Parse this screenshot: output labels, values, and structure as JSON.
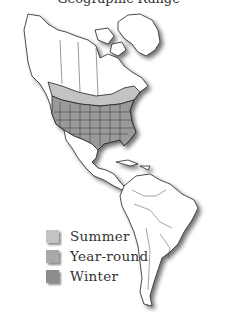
{
  "map": {
    "title": "Geographic Range",
    "region": "The Americas",
    "colors": {
      "summer": "#c3c3c3",
      "year_round": "#a8a8a8",
      "winter": "#8c8c8c",
      "land": "#ffffff",
      "outline": "#222222"
    }
  },
  "legend": {
    "items": [
      {
        "label": "Summer",
        "color": "#c3c3c3"
      },
      {
        "label": "Year-round",
        "color": "#a8a8a8"
      },
      {
        "label": "Winter",
        "color": "#8c8c8c"
      }
    ]
  }
}
